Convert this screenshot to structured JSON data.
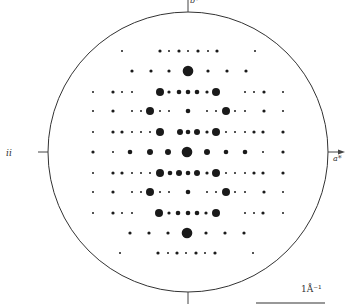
{
  "figure": {
    "type": "diffraction-pattern",
    "circle": {
      "cx": 188,
      "cy": 152,
      "r": 140,
      "stroke": "#333333"
    },
    "axes": {
      "top_label": "b*",
      "right_label": "a*",
      "left_label": "ii"
    },
    "scale_bar": {
      "label": "1Å⁻¹",
      "x1": 256,
      "x2": 325,
      "y": 303
    },
    "spot_color": "#1a1a1a",
    "sizes": {
      "t": 1.0,
      "s": 1.6,
      "m": 2.3,
      "M": 3.0,
      "L": 4.0,
      "X": 5.3
    },
    "rows": [
      {
        "y": 51,
        "spots": [
          [
            122,
            "t"
          ],
          [
            160,
            "s"
          ],
          [
            169,
            "t"
          ],
          [
            179,
            "s"
          ],
          [
            188,
            "t"
          ],
          [
            198,
            "s"
          ],
          [
            208,
            "t"
          ],
          [
            217,
            "s"
          ],
          [
            255,
            "t"
          ]
        ]
      },
      {
        "y": 71,
        "spots": [
          [
            132,
            "s"
          ],
          [
            151,
            "s"
          ],
          [
            169,
            "s"
          ],
          [
            188,
            "X"
          ],
          [
            208,
            "s"
          ],
          [
            227,
            "s"
          ],
          [
            246,
            "s"
          ]
        ]
      },
      {
        "y": 92,
        "spots": [
          [
            93,
            "t"
          ],
          [
            113,
            "s"
          ],
          [
            122,
            "t"
          ],
          [
            132,
            "t"
          ],
          [
            160,
            "L"
          ],
          [
            169,
            "s"
          ],
          [
            179,
            "m"
          ],
          [
            188,
            "m"
          ],
          [
            197,
            "m"
          ],
          [
            207,
            "s"
          ],
          [
            216,
            "L"
          ],
          [
            245,
            "t"
          ],
          [
            254,
            "t"
          ],
          [
            264,
            "s"
          ],
          [
            283,
            "t"
          ]
        ]
      },
      {
        "y": 111,
        "spots": [
          [
            93,
            "t"
          ],
          [
            113,
            "s"
          ],
          [
            132,
            "t"
          ],
          [
            141,
            "t"
          ],
          [
            150,
            "L"
          ],
          [
            160,
            "t"
          ],
          [
            169,
            "t"
          ],
          [
            188,
            "m"
          ],
          [
            207,
            "t"
          ],
          [
            216,
            "t"
          ],
          [
            226,
            "L"
          ],
          [
            235,
            "t"
          ],
          [
            245,
            "t"
          ],
          [
            264,
            "s"
          ],
          [
            283,
            "t"
          ]
        ]
      },
      {
        "y": 132,
        "spots": [
          [
            93,
            "t"
          ],
          [
            113,
            "s"
          ],
          [
            122,
            "s"
          ],
          [
            132,
            "t"
          ],
          [
            141,
            "t"
          ],
          [
            150,
            "t"
          ],
          [
            160,
            "L"
          ],
          [
            180,
            "M"
          ],
          [
            188,
            "m"
          ],
          [
            197,
            "M"
          ],
          [
            207,
            "s"
          ],
          [
            216,
            "L"
          ],
          [
            226,
            "t"
          ],
          [
            235,
            "t"
          ],
          [
            245,
            "t"
          ],
          [
            254,
            "s"
          ],
          [
            263,
            "s"
          ],
          [
            283,
            "s"
          ]
        ]
      },
      {
        "y": 152,
        "spots": [
          [
            93,
            "s"
          ],
          [
            113,
            "t"
          ],
          [
            130,
            "m"
          ],
          [
            150,
            "M"
          ],
          [
            168,
            "M"
          ],
          [
            187,
            "X"
          ],
          [
            207,
            "M"
          ],
          [
            226,
            "m"
          ],
          [
            245,
            "m"
          ],
          [
            263,
            "t"
          ],
          [
            283,
            "s"
          ]
        ]
      },
      {
        "y": 173,
        "spots": [
          [
            93,
            "t"
          ],
          [
            113,
            "s"
          ],
          [
            122,
            "s"
          ],
          [
            132,
            "t"
          ],
          [
            141,
            "t"
          ],
          [
            150,
            "t"
          ],
          [
            160,
            "L"
          ],
          [
            170,
            "m"
          ],
          [
            179,
            "M"
          ],
          [
            188,
            "m"
          ],
          [
            197,
            "M"
          ],
          [
            207,
            "s"
          ],
          [
            216,
            "L"
          ],
          [
            226,
            "t"
          ],
          [
            235,
            "t"
          ],
          [
            245,
            "t"
          ],
          [
            254,
            "s"
          ],
          [
            263,
            "s"
          ],
          [
            283,
            "s"
          ]
        ]
      },
      {
        "y": 192,
        "spots": [
          [
            93,
            "t"
          ],
          [
            113,
            "s"
          ],
          [
            132,
            "t"
          ],
          [
            141,
            "t"
          ],
          [
            150,
            "L"
          ],
          [
            160,
            "t"
          ],
          [
            169,
            "t"
          ],
          [
            188,
            "m"
          ],
          [
            207,
            "t"
          ],
          [
            216,
            "t"
          ],
          [
            226,
            "L"
          ],
          [
            235,
            "t"
          ],
          [
            245,
            "t"
          ],
          [
            264,
            "s"
          ],
          [
            283,
            "t"
          ]
        ]
      },
      {
        "y": 213,
        "spots": [
          [
            93,
            "t"
          ],
          [
            113,
            "s"
          ],
          [
            122,
            "t"
          ],
          [
            132,
            "t"
          ],
          [
            159,
            "L"
          ],
          [
            169,
            "s"
          ],
          [
            178,
            "m"
          ],
          [
            188,
            "m"
          ],
          [
            197,
            "m"
          ],
          [
            206,
            "s"
          ],
          [
            216,
            "L"
          ],
          [
            245,
            "t"
          ],
          [
            254,
            "t"
          ],
          [
            263,
            "s"
          ],
          [
            283,
            "t"
          ]
        ]
      },
      {
        "y": 233,
        "spots": [
          [
            130,
            "s"
          ],
          [
            149,
            "s"
          ],
          [
            168,
            "s"
          ],
          [
            187,
            "X"
          ],
          [
            206,
            "s"
          ],
          [
            225,
            "s"
          ],
          [
            244,
            "s"
          ]
        ]
      },
      {
        "y": 253,
        "spots": [
          [
            120,
            "t"
          ],
          [
            158,
            "s"
          ],
          [
            168,
            "t"
          ],
          [
            177,
            "s"
          ],
          [
            186,
            "t"
          ],
          [
            196,
            "s"
          ],
          [
            205,
            "t"
          ],
          [
            215,
            "s"
          ],
          [
            253,
            "t"
          ]
        ]
      }
    ]
  }
}
